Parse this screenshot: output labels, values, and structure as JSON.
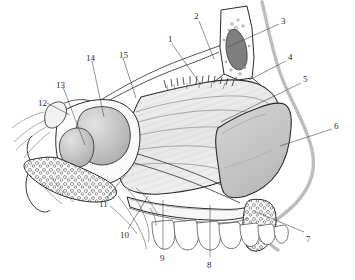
{
  "figure": {
    "type": "anatomical-line-illustration",
    "width": 355,
    "height": 280,
    "background_color": "#ffffff",
    "ink_color": "#1f1f1f",
    "profile_color": "#b9b9b9"
  },
  "palette": {
    "paper": "#ffffff",
    "line": "#1f1f1f",
    "line_soft": "#6a6a6a",
    "profile_curve": "#bdbdbd",
    "tint_light": "#e9e9e9",
    "tint_mid": "#d2d2d2",
    "tint_dark": "#a8a8a8",
    "sinus_cavity": "#8c8c8c",
    "septum_wash": "#efefef"
  },
  "labels": [
    {
      "id": "1",
      "text": "1",
      "x": 168,
      "y": 35,
      "leader": "M 172 44 L 201 85"
    },
    {
      "id": "2",
      "text": "2",
      "x": 194,
      "y": 12,
      "leader": "M 199 21 L 214 59"
    },
    {
      "id": "3",
      "text": "3",
      "x": 281,
      "y": 17,
      "leader": "M 279 24 L 228 47"
    },
    {
      "id": "4",
      "text": "4",
      "x": 288,
      "y": 53,
      "leader": "M 286 61 L 249 80"
    },
    {
      "id": "5",
      "text": "5",
      "x": 303,
      "y": 75,
      "leader": "M 301 83 L 221 122"
    },
    {
      "id": "6",
      "text": "6",
      "x": 334,
      "y": 122,
      "leader": "M 332 129 L 280 146"
    },
    {
      "id": "7",
      "text": "7",
      "x": 306,
      "y": 235,
      "leader": "M 304 232 L 254 211"
    },
    {
      "id": "8",
      "text": "8",
      "x": 207,
      "y": 261,
      "leader": "M 210 257 L 210 205"
    },
    {
      "id": "9",
      "text": "9",
      "x": 160,
      "y": 254,
      "leader": "M 163 250 L 163 200"
    },
    {
      "id": "10",
      "text": "10",
      "x": 120,
      "y": 231,
      "leader": "M 128 229 L 148 196"
    },
    {
      "id": "11",
      "text": "11",
      "x": 99,
      "y": 200,
      "leader": "M 107 198 L 131 168"
    },
    {
      "id": "12",
      "text": "12",
      "x": 38,
      "y": 99,
      "leader": "M 47 103 L 70 115"
    },
    {
      "id": "13",
      "text": "13",
      "x": 56,
      "y": 81,
      "leader": "M 63 87 L 85 145"
    },
    {
      "id": "14",
      "text": "14",
      "x": 86,
      "y": 54,
      "leader": "M 92 61 L 104 117"
    },
    {
      "id": "15",
      "text": "15",
      "x": 119,
      "y": 51,
      "leader": "M 123 58 L 136 98"
    }
  ],
  "regions": [
    {
      "name": "frontal-sinus",
      "tint": "#8c8c8c"
    },
    {
      "name": "nasal-septum-wash",
      "tint": "#efefef"
    },
    {
      "name": "lateral-nasal-wall",
      "tint": "#e4e4e4"
    },
    {
      "name": "nasal-cartilage-block",
      "tint": "#c8c8c8"
    },
    {
      "name": "sphenoid-sinus-body",
      "tint": "#cfcfcf"
    },
    {
      "name": "pterygoid-trabecular-bone",
      "tint": "#f2f2f2"
    },
    {
      "name": "maxillary-tuberosity-bone",
      "tint": "#f2f2f2"
    },
    {
      "name": "teeth-row",
      "tint": "#ffffff"
    }
  ],
  "counts": {
    "label_total": 15,
    "teeth_visible": 7
  }
}
